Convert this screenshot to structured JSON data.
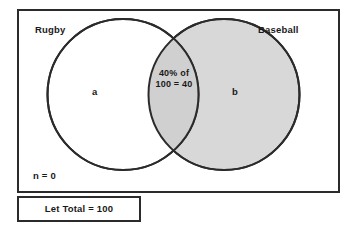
{
  "diagram": {
    "type": "venn-two-set",
    "universe": {
      "label_outside_count": "n = 0",
      "border_color": "#2b2b2b",
      "fill_color": "#ffffff"
    },
    "sets": [
      {
        "id": "left",
        "name": "Rugby",
        "region_label": "a",
        "fill_color": "#ffffff",
        "stroke_color": "#2b2b2b"
      },
      {
        "id": "right",
        "name": "Baseball",
        "region_label": "b",
        "fill_color": "#d8d8d8",
        "stroke_color": "#2b2b2b"
      }
    ],
    "intersection": {
      "line1": "40% of",
      "line2": "100 = 40",
      "fill_color": "#d0d0d0",
      "value": 40,
      "percent": 40,
      "of_total": 100
    },
    "caption": {
      "text": "Let Total = 100",
      "border_color": "#2b2b2b"
    }
  }
}
